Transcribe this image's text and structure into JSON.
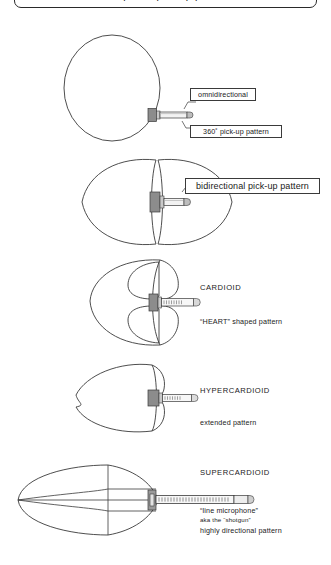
{
  "header": {
    "title": "microphone pick-up patterns"
  },
  "sections": [
    {
      "id": "omnidirectional",
      "pattern_name": "omnidirectional",
      "labels": [
        {
          "name": "omnidirectional-callout",
          "text": "omnidirectional"
        },
        {
          "name": "pickup-pattern-callout",
          "text": "360˚ pick-up pattern"
        }
      ]
    },
    {
      "id": "bidirectional",
      "pattern_name": "bidirectional",
      "labels": [
        {
          "name": "bidirectional-callout",
          "text": "bidirectional pick-up pattern"
        }
      ]
    },
    {
      "id": "cardioid",
      "pattern_name": "CARDIOID",
      "labels": [
        {
          "name": "cardioid-heading",
          "text": "CARDIOID"
        },
        {
          "name": "cardioid-description",
          "text": "“HEART” shaped pattern"
        }
      ]
    },
    {
      "id": "hypercardioid",
      "pattern_name": "HYPERCARDIOID",
      "labels": [
        {
          "name": "hypercardioid-heading",
          "text": "HYPERCARDIOID"
        },
        {
          "name": "hypercardioid-description",
          "text": "extended pattern"
        }
      ]
    },
    {
      "id": "supercardioid",
      "pattern_name": "SUPERCARDIOID",
      "labels": [
        {
          "name": "supercardioid-heading",
          "text": "SUPERCARDIOID"
        },
        {
          "name": "supercardioid-description-1",
          "text": "“line microphone”"
        },
        {
          "name": "supercardioid-description-2",
          "text": "aka the “shotgun”"
        },
        {
          "name": "supercardioid-description-3",
          "text": "highly directional pattern"
        }
      ]
    }
  ],
  "colors": {
    "stroke": "#3a3a3a",
    "mic_capsule": "#8c8c8c",
    "mic_body": "#e8e8e8",
    "background": "#ffffff"
  }
}
